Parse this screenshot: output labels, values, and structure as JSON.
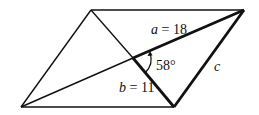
{
  "figure": {
    "type": "parallelogram-with-diagonals",
    "vertices": {
      "top_left": [
        91,
        10
      ],
      "top_right": [
        244,
        10
      ],
      "bottom_right": [
        174,
        107
      ],
      "bottom_left": [
        21,
        107
      ]
    },
    "intersection": [
      133,
      58
    ],
    "labels": {
      "a_var": "a",
      "a_eq": " = 18",
      "b_var": "b",
      "b_eq": " = 11",
      "angle": "58°",
      "c_var": "c"
    },
    "values": {
      "a": 18,
      "b": 11,
      "angle_deg": 58
    },
    "colors": {
      "stroke": "#111111",
      "background": "#ffffff"
    }
  }
}
